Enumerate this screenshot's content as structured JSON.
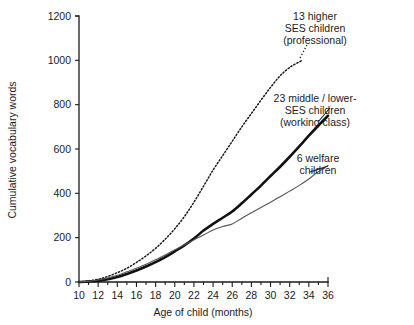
{
  "chart_data": {
    "type": "line",
    "title": "",
    "xlabel": "Age of child (months)",
    "ylabel": "Cumulative vocabulary words",
    "xlim": [
      10,
      36
    ],
    "ylim": [
      0,
      1200
    ],
    "xticks": [
      10,
      12,
      14,
      16,
      18,
      20,
      22,
      24,
      26,
      28,
      30,
      32,
      34,
      36
    ],
    "yticks": [
      0,
      200,
      400,
      600,
      800,
      1000,
      1200
    ],
    "xtick_labels": [
      "10",
      "12",
      "14",
      "16",
      "18",
      "20",
      "22",
      "24",
      "26",
      "28",
      "30",
      "32",
      "34",
      "36"
    ],
    "ytick_labels": [
      "0",
      "200",
      "400",
      "600",
      "800",
      "1000",
      "1200"
    ],
    "grid": false,
    "legend_position": "inline-annotations",
    "series": [
      {
        "name": "13 higher SES children (professional)",
        "style": "dotted",
        "color": "#1b1b1b",
        "x": [
          10,
          11,
          12,
          13,
          14,
          15,
          16,
          17,
          18,
          19,
          20,
          21,
          22,
          23,
          24,
          25,
          26,
          27,
          28,
          29,
          30,
          31,
          32,
          33.3
        ],
        "values": [
          0,
          5,
          12,
          25,
          42,
          62,
          88,
          118,
          152,
          193,
          240,
          295,
          360,
          432,
          505,
          570,
          635,
          700,
          760,
          820,
          878,
          930,
          968,
          1000
        ]
      },
      {
        "name": "23 middle / lower-SES children (working class)",
        "style": "thick-solid",
        "color": "#111111",
        "x": [
          10,
          11,
          12,
          13,
          14,
          15,
          16,
          17,
          18,
          19,
          20,
          21,
          22,
          23,
          24,
          25,
          26,
          27,
          28,
          29,
          30,
          31,
          32,
          33,
          34,
          35,
          36
        ],
        "values": [
          0,
          2,
          6,
          12,
          22,
          36,
          52,
          70,
          90,
          112,
          138,
          165,
          196,
          232,
          262,
          290,
          318,
          355,
          395,
          435,
          478,
          520,
          565,
          612,
          660,
          706,
          750
        ]
      },
      {
        "name": "6 welfare children",
        "style": "thin-solid",
        "color": "#555555",
        "x": [
          10,
          11,
          12,
          13,
          14,
          15,
          16,
          17,
          18,
          19,
          20,
          21,
          22,
          23,
          24,
          25,
          26,
          27,
          28,
          29,
          30,
          31,
          32,
          33,
          34,
          35,
          36
        ],
        "values": [
          0,
          3,
          9,
          18,
          30,
          46,
          62,
          80,
          100,
          122,
          145,
          168,
          190,
          212,
          235,
          250,
          262,
          288,
          312,
          336,
          360,
          385,
          410,
          436,
          465,
          498,
          525
        ]
      }
    ],
    "annotations": [
      {
        "id": "annot-professional",
        "lines": [
          "13 higher",
          "SES children",
          "(professional)"
        ],
        "anchor_x": 315,
        "anchor_y": 10,
        "align": "middle",
        "leader": {
          "x1": 300,
          "y1": 58,
          "x2": 307,
          "y2": 45,
          "style": "dotted"
        }
      },
      {
        "id": "annot-working-class",
        "lines": [
          "23 middle / lower-",
          "SES children",
          "(working class)"
        ],
        "anchor_x": 315,
        "anchor_y": 92,
        "align": "middle",
        "leader": {
          "x1": 318,
          "y1": 122,
          "x2": 330,
          "y2": 108,
          "style": "solid"
        }
      },
      {
        "id": "annot-welfare",
        "lines": [
          "6 welfare",
          "children"
        ],
        "anchor_x": 318,
        "anchor_y": 152,
        "align": "middle",
        "leader": {
          "x1": 310,
          "y1": 172,
          "x2": 328,
          "y2": 166,
          "style": "solid"
        }
      }
    ]
  },
  "axes": {
    "y_axis_label": "Cumulative vocabulary words",
    "x_axis_label": "Age of child (months)"
  }
}
